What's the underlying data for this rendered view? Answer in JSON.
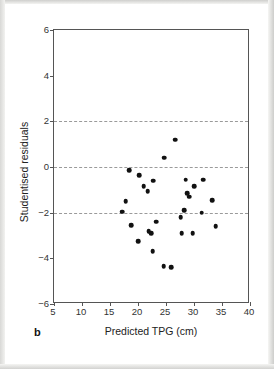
{
  "figure": {
    "panel_label": "b",
    "frame_color": "#555555",
    "point_color": "#111111",
    "gridline_color": "#9a9a9a",
    "background": "#ffffff"
  },
  "chart_data": {
    "type": "scatter",
    "title": "",
    "xlabel": "Predicted TPG (cm)",
    "ylabel": "Studentised residuals",
    "xlim": [
      5,
      40
    ],
    "ylim": [
      -6,
      6
    ],
    "xticks": [
      5,
      10,
      15,
      20,
      25,
      30,
      35,
      40
    ],
    "yticks": [
      6,
      4,
      2,
      0,
      -2,
      -4,
      -6
    ],
    "xticklabels": [
      "5",
      "10",
      "15",
      "20",
      "25",
      "30",
      "35",
      "40"
    ],
    "yticklabels": [
      "6",
      "4",
      "2",
      "0",
      "−2",
      "−4",
      "−6"
    ],
    "grid": false,
    "legend": null,
    "reference_lines": [
      {
        "axis": "y",
        "value": 2,
        "style": "dashed"
      },
      {
        "axis": "y",
        "value": 0,
        "style": "dashed"
      },
      {
        "axis": "y",
        "value": -2,
        "style": "dashed"
      }
    ],
    "series": [
      {
        "name": "Studentised residuals vs predicted TPG",
        "marker": "circle",
        "color": "#111111",
        "points": [
          {
            "x": 26.6,
            "y": 1.2
          },
          {
            "x": 24.7,
            "y": 0.4
          },
          {
            "x": 18.4,
            "y": -0.15
          },
          {
            "x": 20.2,
            "y": -0.35
          },
          {
            "x": 22.7,
            "y": -0.6
          },
          {
            "x": 28.5,
            "y": -0.55
          },
          {
            "x": 31.6,
            "y": -0.55
          },
          {
            "x": 21.0,
            "y": -0.85
          },
          {
            "x": 30.0,
            "y": -0.85
          },
          {
            "x": 21.7,
            "y": -1.05
          },
          {
            "x": 28.8,
            "y": -1.15
          },
          {
            "x": 29.1,
            "y": -1.3
          },
          {
            "x": 17.8,
            "y": -1.5
          },
          {
            "x": 33.2,
            "y": -1.45
          },
          {
            "x": 17.2,
            "y": -1.95
          },
          {
            "x": 28.2,
            "y": -1.9
          },
          {
            "x": 31.4,
            "y": -2.0
          },
          {
            "x": 27.6,
            "y": -2.2
          },
          {
            "x": 23.3,
            "y": -2.4
          },
          {
            "x": 18.8,
            "y": -2.55
          },
          {
            "x": 33.9,
            "y": -2.6
          },
          {
            "x": 21.9,
            "y": -2.8
          },
          {
            "x": 22.4,
            "y": -2.9
          },
          {
            "x": 27.8,
            "y": -2.9
          },
          {
            "x": 29.8,
            "y": -2.9
          },
          {
            "x": 20.0,
            "y": -3.25
          },
          {
            "x": 22.6,
            "y": -3.7
          },
          {
            "x": 24.6,
            "y": -4.35
          },
          {
            "x": 25.9,
            "y": -4.4
          }
        ]
      }
    ]
  }
}
